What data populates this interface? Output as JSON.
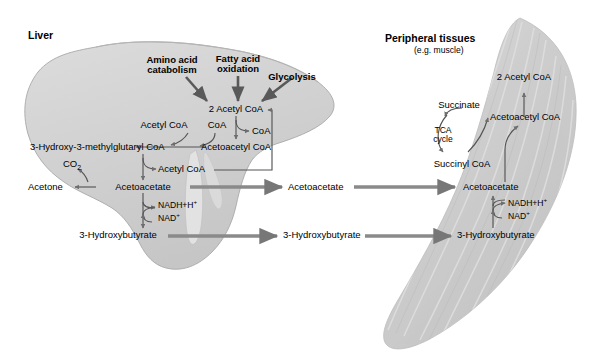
{
  "figure": {
    "organs": {
      "liver_label": "Liver",
      "peripheral_label": "Peripheral tissues",
      "peripheral_sublabel": "(e.g. muscle)"
    },
    "colors": {
      "liver_fill": "#d2d2d2",
      "liver_edge": "#9a9a9a",
      "muscle_fill": "#c9c9c9",
      "muscle_stripe": "#dcdcdc",
      "arrow": "#595959",
      "transport_arrow": "#808080",
      "text": "#000000",
      "background": "#ffffff"
    },
    "inputs": [
      {
        "label": "Amino acid catabolism",
        "line1": "Amino acid",
        "line2": "catabolism"
      },
      {
        "label": "Fatty acid oxidation",
        "line1": "Fatty acid",
        "line2": "oxidation"
      },
      {
        "label": "Glycolysis",
        "line1": "Glycolysis",
        "line2": ""
      }
    ],
    "liver_metabolites": {
      "two_acetyl_coa": "2 Acetyl CoA",
      "coa_released": "CoA",
      "acetoacetyl_coa": "Acetoacetyl CoA",
      "acetyl_coa_in": "Acetyl CoA",
      "coa_in": "CoA",
      "hmg_coa": "3-Hydroxy-3-methylglutaryl CoA",
      "acetyl_coa_out": "Acetyl CoA",
      "co2": "CO2",
      "acetone": "Acetone",
      "acetoacetate": "Acetoacetate",
      "nadh": "NADH+H",
      "nadh_sup": "+",
      "nad": "NAD",
      "nad_sup": "+",
      "hydroxybutyrate": "3-Hydroxybutyrate"
    },
    "blood_transport": {
      "acetoacetate": "Acetoacetate",
      "hydroxybutyrate": "3-Hydroxybutyrate"
    },
    "peripheral_metabolites": {
      "two_acetyl_coa": "2 Acetyl CoA",
      "acetoacetyl_coa": "Acetoacetyl CoA",
      "succinate": "Succinate",
      "succinyl_coa": "Succinyl CoA",
      "tca_line1": "TCA",
      "tca_line2": "cycle",
      "acetoacetate": "Acetoacetate",
      "nadh": "NADH+H",
      "nadh_sup": "+",
      "nad": "NAD",
      "nad_sup": "+",
      "hydroxybutyrate": "3-Hydroxybutyrate"
    }
  }
}
